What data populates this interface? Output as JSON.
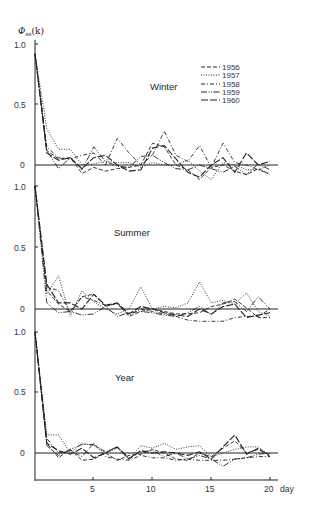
{
  "chart_data": [
    {
      "type": "line",
      "title": "Winter",
      "ylabel": "Φ_ss(k)",
      "xlabel": "day",
      "ylim": [
        -0.1,
        1.0
      ],
      "yticks": [
        "1.0",
        "0.5",
        "0"
      ],
      "x": [
        0,
        1,
        2,
        3,
        4,
        5,
        6,
        7,
        8,
        9,
        10,
        11,
        12,
        13,
        14,
        15,
        16,
        17,
        18,
        19,
        20
      ],
      "series": [
        {
          "name": "1956",
          "dash": "dashed",
          "values": [
            0.92,
            0.12,
            0.05,
            0.06,
            -0.07,
            -0.02,
            -0.05,
            -0.03,
            -0.02,
            0.0,
            0.18,
            0.15,
            0.0,
            -0.04,
            -0.12,
            -0.02,
            0.0,
            -0.05,
            -0.08,
            -0.03,
            -0.08
          ]
        },
        {
          "name": "1957",
          "dash": "dotted",
          "values": [
            0.92,
            0.3,
            0.13,
            0.13,
            0.0,
            0.01,
            0.03,
            0.02,
            0.02,
            -0.02,
            0.02,
            0.0,
            0.0,
            0.04,
            -0.05,
            -0.12,
            0.02,
            0.0,
            -0.04,
            -0.04,
            0.0
          ]
        },
        {
          "name": "1958",
          "dash": "dashdot",
          "values": [
            0.92,
            0.15,
            0.06,
            0.05,
            0.08,
            0.1,
            0.0,
            0.22,
            0.1,
            0.0,
            0.08,
            0.28,
            0.08,
            0.03,
            0.16,
            -0.02,
            0.18,
            0.02,
            0.0,
            -0.04,
            -0.07
          ]
        },
        {
          "name": "1959",
          "dash": "dashdotdot",
          "values": [
            0.92,
            0.12,
            -0.03,
            0.06,
            -0.04,
            0.15,
            0.03,
            -0.01,
            -0.02,
            0.07,
            0.08,
            0.02,
            -0.03,
            -0.04,
            0.0,
            -0.03,
            -0.06,
            -0.01,
            -0.08,
            0.01,
            -0.04
          ]
        },
        {
          "name": "1960",
          "dash": "longdash",
          "values": [
            0.92,
            0.1,
            0.04,
            0.06,
            -0.03,
            0.06,
            0.08,
            0.0,
            -0.05,
            -0.04,
            0.14,
            0.16,
            0.05,
            -0.06,
            -0.1,
            0.0,
            0.06,
            -0.06,
            0.1,
            0.0,
            0.03
          ]
        }
      ]
    },
    {
      "type": "line",
      "title": "Summer",
      "ylabel": "Φ_ss(k)",
      "xlabel": "day",
      "ylim": [
        -0.1,
        1.0
      ],
      "yticks": [
        "1.0",
        "0.5",
        "0"
      ],
      "x": [
        0,
        1,
        2,
        3,
        4,
        5,
        6,
        7,
        8,
        9,
        10,
        11,
        12,
        13,
        14,
        15,
        16,
        17,
        18,
        19,
        20
      ],
      "series": [
        {
          "name": "1956",
          "dash": "dashed",
          "values": [
            1.0,
            0.15,
            0.04,
            -0.02,
            0.1,
            0.12,
            0.02,
            0.05,
            -0.06,
            -0.02,
            0.0,
            -0.02,
            -0.04,
            -0.04,
            -0.03,
            0.02,
            0.04,
            0.08,
            0.01,
            -0.07,
            -0.07
          ]
        },
        {
          "name": "1957",
          "dash": "dotted",
          "values": [
            1.0,
            0.12,
            0.27,
            -0.06,
            0.15,
            0.06,
            0.0,
            -0.04,
            0.0,
            0.18,
            0.0,
            0.02,
            0.01,
            0.05,
            0.22,
            0.05,
            0.07,
            0.04,
            0.13,
            -0.02,
            -0.06
          ]
        },
        {
          "name": "1958",
          "dash": "dashdot",
          "values": [
            1.0,
            0.18,
            0.15,
            -0.03,
            0.1,
            0.07,
            0.03,
            0.04,
            -0.05,
            0.0,
            -0.02,
            -0.04,
            -0.06,
            -0.09,
            -0.1,
            -0.1,
            -0.1,
            -0.07,
            -0.06,
            -0.06,
            0.0
          ]
        },
        {
          "name": "1959",
          "dash": "dashdotdot",
          "values": [
            1.0,
            0.05,
            -0.03,
            -0.02,
            -0.05,
            -0.04,
            0.02,
            -0.06,
            -0.03,
            -0.02,
            -0.03,
            -0.05,
            -0.06,
            -0.03,
            0.02,
            -0.05,
            0.05,
            0.06,
            -0.02,
            0.1,
            0.0
          ]
        },
        {
          "name": "1960",
          "dash": "longdash",
          "values": [
            1.0,
            0.2,
            0.05,
            0.05,
            0.0,
            0.12,
            0.03,
            0.05,
            -0.04,
            0.02,
            0.0,
            -0.03,
            -0.05,
            -0.06,
            0.0,
            -0.04,
            0.02,
            0.04,
            -0.07,
            -0.05,
            -0.03
          ]
        }
      ]
    },
    {
      "type": "line",
      "title": "Year",
      "ylabel": "Φ_ss(k)",
      "xlabel": "day",
      "ylim": [
        -0.2,
        1.0
      ],
      "yticks": [
        "1.0",
        "0.5",
        "0"
      ],
      "xticks": [
        "5",
        "10",
        "15",
        "20"
      ],
      "x": [
        0,
        1,
        2,
        3,
        4,
        5,
        6,
        7,
        8,
        9,
        10,
        11,
        12,
        13,
        14,
        15,
        16,
        17,
        18,
        19,
        20
      ],
      "series": [
        {
          "name": "1956",
          "dash": "dashed",
          "values": [
            1.0,
            0.08,
            -0.04,
            0.03,
            -0.06,
            -0.05,
            0.0,
            -0.06,
            -0.02,
            -0.01,
            0.03,
            0.0,
            -0.05,
            -0.06,
            0.0,
            -0.03,
            0.04,
            0.1,
            0.0,
            0.03,
            -0.02
          ]
        },
        {
          "name": "1957",
          "dash": "dotted",
          "values": [
            1.0,
            0.15,
            0.15,
            0.0,
            0.08,
            0.06,
            0.0,
            0.04,
            -0.05,
            0.06,
            0.04,
            0.08,
            0.03,
            0.05,
            0.06,
            -0.03,
            0.0,
            0.03,
            0.05,
            0.05,
            -0.02
          ]
        },
        {
          "name": "1958",
          "dash": "dashdot",
          "values": [
            1.0,
            0.12,
            0.0,
            0.02,
            -0.03,
            0.08,
            -0.03,
            -0.05,
            -0.06,
            -0.02,
            -0.04,
            -0.04,
            -0.06,
            -0.05,
            -0.06,
            -0.06,
            -0.06,
            -0.05,
            -0.04,
            -0.03,
            -0.03
          ]
        },
        {
          "name": "1959",
          "dash": "dashdotdot",
          "values": [
            1.0,
            0.06,
            -0.02,
            0.03,
            0.07,
            0.07,
            0.01,
            0.05,
            -0.04,
            0.01,
            0.02,
            -0.03,
            0.0,
            -0.05,
            -0.02,
            -0.05,
            -0.11,
            -0.05,
            -0.04,
            -0.01,
            0.0
          ]
        },
        {
          "name": "1960",
          "dash": "longdash",
          "values": [
            1.0,
            0.08,
            0.02,
            -0.01,
            0.04,
            -0.04,
            0.0,
            0.05,
            -0.05,
            0.02,
            0.0,
            0.01,
            0.0,
            -0.02,
            0.01,
            -0.05,
            0.05,
            0.15,
            -0.01,
            0.04,
            -0.03
          ]
        }
      ]
    }
  ],
  "axis": {
    "ylabel": "Φ",
    "ylabel_sub": "ss",
    "ylabel_suffix": "(k)",
    "xlabel": "day",
    "xticks": [
      "5",
      "10",
      "15",
      "20"
    ]
  },
  "panels": [
    {
      "title": "Winter",
      "ticks": [
        "1.0",
        "0.5",
        "0"
      ]
    },
    {
      "title": "Summer",
      "ticks": [
        "1.0",
        "0.5",
        "0"
      ]
    },
    {
      "title": "Year",
      "ticks": [
        "1.0",
        "0.5",
        "0"
      ]
    }
  ],
  "legend": [
    {
      "label": "1956",
      "dash": "dashed"
    },
    {
      "label": "1957",
      "dash": "dotted"
    },
    {
      "label": "1958",
      "dash": "dashdot"
    },
    {
      "label": "1959",
      "dash": "dashdotdot"
    },
    {
      "label": "1960",
      "dash": "longdash"
    }
  ]
}
